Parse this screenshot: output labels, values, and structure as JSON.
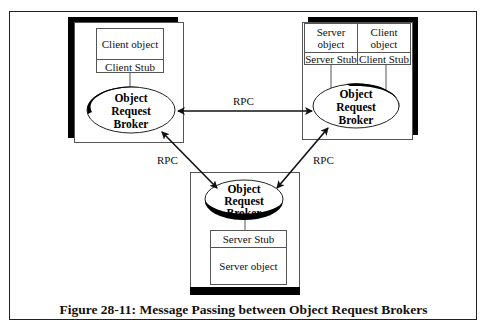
{
  "diagram": {
    "nodes": {
      "client": {
        "object_label": "Client object",
        "stub_label": "Client Stub",
        "orb_label": [
          "Object",
          "Request",
          "Broker"
        ]
      },
      "server_client": {
        "server_object_label": "Server object",
        "server_object_lines": [
          "Server",
          "object"
        ],
        "client_object_lines": [
          "Client",
          "object"
        ],
        "server_stub_label": "Server Stub",
        "client_stub_label": "Client Stub",
        "orb_label": [
          "Object",
          "Request",
          "Broker"
        ]
      },
      "server": {
        "orb_label": [
          "Object",
          "Request",
          "Broker"
        ],
        "stub_label": "Server Stub",
        "object_label": "Server object"
      }
    },
    "edges": [
      {
        "from": "client",
        "to": "server_client",
        "label": "RPC",
        "bidirectional": true
      },
      {
        "from": "client",
        "to": "server",
        "label": "RPC",
        "bidirectional": true
      },
      {
        "from": "server_client",
        "to": "server",
        "label": "RPC",
        "bidirectional": true
      }
    ],
    "caption": "Figure 28-11: Message Passing between Object Request Brokers"
  }
}
